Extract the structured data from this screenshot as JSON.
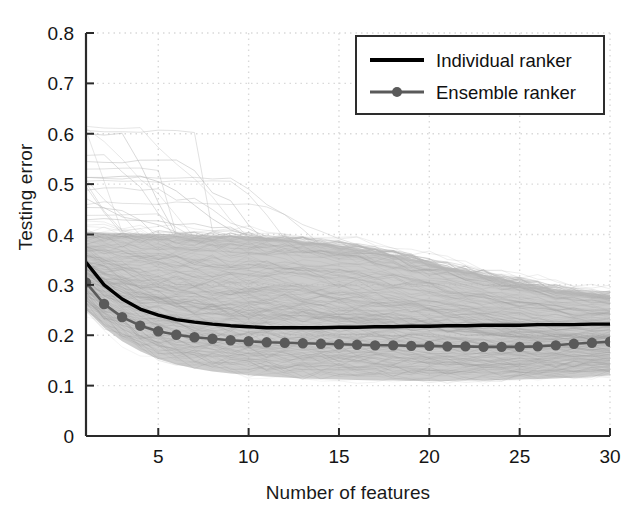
{
  "chart_data": {
    "type": "line",
    "title": "",
    "xlabel": "Number of features",
    "ylabel": "Testing error",
    "xlim": [
      1,
      30
    ],
    "ylim": [
      0,
      0.8
    ],
    "grid": true,
    "xticks": [
      5,
      10,
      15,
      20,
      25,
      30
    ],
    "xtick_labels": [
      "5",
      "10",
      "15",
      "20",
      "25",
      "30"
    ],
    "yticks": [
      0,
      0.1,
      0.2,
      0.3,
      0.4,
      0.5,
      0.6,
      0.7,
      0.8
    ],
    "ytick_labels": [
      "0",
      "0.1",
      "0.2",
      "0.3",
      "0.4",
      "0.5",
      "0.6",
      "0.7",
      "0.8"
    ],
    "legend_position": "top-right",
    "x": [
      1,
      2,
      3,
      4,
      5,
      6,
      7,
      8,
      9,
      10,
      11,
      12,
      13,
      14,
      15,
      16,
      17,
      18,
      19,
      20,
      21,
      22,
      23,
      24,
      25,
      26,
      27,
      28,
      29,
      30
    ],
    "series": [
      {
        "name": "Individual ranker",
        "color": "#000000",
        "style": "solid",
        "marker": "none",
        "values": [
          0.345,
          0.3,
          0.272,
          0.252,
          0.24,
          0.231,
          0.226,
          0.222,
          0.219,
          0.217,
          0.215,
          0.215,
          0.215,
          0.215,
          0.216,
          0.216,
          0.217,
          0.217,
          0.218,
          0.218,
          0.219,
          0.219,
          0.22,
          0.22,
          0.22,
          0.221,
          0.221,
          0.221,
          0.222,
          0.222
        ]
      },
      {
        "name": "Ensemble ranker",
        "color": "#5a5a5a",
        "style": "solid",
        "marker": "circle",
        "values": [
          0.305,
          0.262,
          0.236,
          0.219,
          0.208,
          0.201,
          0.196,
          0.193,
          0.19,
          0.188,
          0.186,
          0.185,
          0.184,
          0.183,
          0.182,
          0.181,
          0.18,
          0.18,
          0.179,
          0.179,
          0.178,
          0.178,
          0.177,
          0.177,
          0.177,
          0.178,
          0.18,
          0.183,
          0.185,
          0.187
        ]
      }
    ],
    "background_band": {
      "name": "individual run spread",
      "color": "#b9b9b9",
      "upper": [
        0.405,
        0.404,
        0.403,
        0.402,
        0.401,
        0.4,
        0.399,
        0.398,
        0.397,
        0.396,
        0.394,
        0.391,
        0.387,
        0.383,
        0.378,
        0.373,
        0.367,
        0.36,
        0.352,
        0.344,
        0.336,
        0.328,
        0.32,
        0.312,
        0.305,
        0.298,
        0.292,
        0.287,
        0.283,
        0.28
      ],
      "lower": [
        0.25,
        0.215,
        0.188,
        0.168,
        0.153,
        0.142,
        0.134,
        0.128,
        0.124,
        0.121,
        0.118,
        0.116,
        0.114,
        0.113,
        0.112,
        0.111,
        0.11,
        0.11,
        0.109,
        0.109,
        0.109,
        0.11,
        0.11,
        0.111,
        0.112,
        0.113,
        0.114,
        0.116,
        0.118,
        0.12
      ]
    },
    "outlier_lines_note": "faint light-gray individual curves descending from about 0.61 and 0.51 toward the main band between features 1 and 15"
  },
  "legend": {
    "entries": [
      {
        "label": "Individual ranker",
        "marker": "line"
      },
      {
        "label": "Ensemble ranker",
        "marker": "line-circle"
      }
    ]
  },
  "axes": {
    "x_title": "Number of features",
    "y_title": "Testing error"
  },
  "colors": {
    "individual": "#000000",
    "ensemble": "#5a5a5a",
    "band": "#b9b9b9",
    "grid": "#d9d9d9",
    "axis": "#2a2a2a"
  }
}
